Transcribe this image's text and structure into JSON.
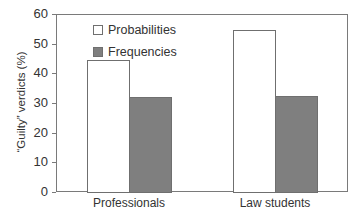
{
  "chart_data": {
    "type": "bar",
    "title": "",
    "xlabel": "",
    "ylabel": "“Guilty” verdicts (%)",
    "ylim": [
      0,
      60
    ],
    "yticks": [
      0,
      10,
      20,
      30,
      40,
      50,
      60
    ],
    "categories": [
      "Professionals",
      "Law students"
    ],
    "series": [
      {
        "name": "Probabilities",
        "color": "#ffffff",
        "values": [
          44.5,
          54.5
        ]
      },
      {
        "name": "Frequencies",
        "color": "#7f7f7f",
        "values": [
          32,
          32.5
        ]
      }
    ],
    "legend_position": "upper left",
    "grid": false
  },
  "ytick_labels": [
    "0",
    "10",
    "20",
    "30",
    "40",
    "50",
    "60"
  ]
}
